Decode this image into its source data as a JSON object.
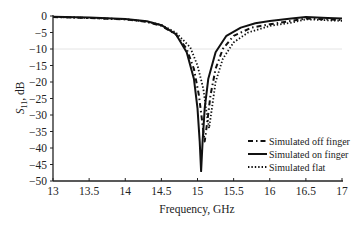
{
  "chart_data": {
    "type": "line",
    "title": "",
    "xlabel": "Frequency, GHz",
    "ylabel_main": "S",
    "ylabel_sub": "11",
    "ylabel_suffix": ", dB",
    "xlim": [
      13,
      17
    ],
    "ylim": [
      -50,
      0
    ],
    "xticks": [
      13,
      13.5,
      14,
      14.5,
      15,
      15.5,
      16,
      16.5,
      17
    ],
    "xtick_labels": [
      "13",
      "13.5",
      "14",
      "14.5",
      "15",
      "15.5",
      "16",
      "16.5",
      "17"
    ],
    "yticks": [
      0,
      -5,
      -10,
      -15,
      -20,
      -25,
      -30,
      -35,
      -40,
      -45,
      -50
    ],
    "ytick_labels": [
      "0",
      "−5",
      "−10",
      "−15",
      "−20",
      "−25",
      "−30",
      "−35",
      "−40",
      "−45",
      "−50"
    ],
    "reference_line": -10,
    "grid": false,
    "legend_position": "lower right",
    "series": [
      {
        "name": "Simulated off finger",
        "style": "dashdot",
        "points": [
          [
            13,
            -0.3
          ],
          [
            13.5,
            -0.6
          ],
          [
            14,
            -1.0
          ],
          [
            14.3,
            -1.8
          ],
          [
            14.5,
            -3.0
          ],
          [
            14.7,
            -5.5
          ],
          [
            14.85,
            -10
          ],
          [
            14.95,
            -16
          ],
          [
            15.02,
            -24
          ],
          [
            15.07,
            -33
          ],
          [
            15.1,
            -38
          ],
          [
            15.13,
            -33
          ],
          [
            15.18,
            -24
          ],
          [
            15.25,
            -16
          ],
          [
            15.35,
            -10
          ],
          [
            15.5,
            -6
          ],
          [
            15.75,
            -3.5
          ],
          [
            16,
            -2.5
          ],
          [
            16.3,
            -1.5
          ],
          [
            16.5,
            -0.8
          ],
          [
            16.8,
            -1.0
          ],
          [
            17,
            -1.2
          ]
        ]
      },
      {
        "name": "Simulated on finger",
        "style": "solid",
        "points": [
          [
            13,
            -0.2
          ],
          [
            13.5,
            -0.5
          ],
          [
            14,
            -0.9
          ],
          [
            14.3,
            -1.6
          ],
          [
            14.5,
            -2.8
          ],
          [
            14.7,
            -5.5
          ],
          [
            14.85,
            -11
          ],
          [
            14.95,
            -19
          ],
          [
            15.0,
            -28
          ],
          [
            15.03,
            -38
          ],
          [
            15.05,
            -47
          ],
          [
            15.07,
            -38
          ],
          [
            15.1,
            -28
          ],
          [
            15.15,
            -19
          ],
          [
            15.25,
            -11
          ],
          [
            15.4,
            -6
          ],
          [
            15.6,
            -3.5
          ],
          [
            15.8,
            -2.2
          ],
          [
            16,
            -1.5
          ],
          [
            16.3,
            -0.8
          ],
          [
            16.5,
            -0.3
          ],
          [
            16.8,
            -0.6
          ],
          [
            17,
            -0.8
          ]
        ]
      },
      {
        "name": "Simulated flat",
        "style": "dotted",
        "points": [
          [
            13,
            -0.3
          ],
          [
            13.5,
            -0.6
          ],
          [
            14,
            -1.0
          ],
          [
            14.3,
            -1.7
          ],
          [
            14.5,
            -2.7
          ],
          [
            14.7,
            -5.0
          ],
          [
            14.9,
            -9.5
          ],
          [
            15.0,
            -15
          ],
          [
            15.08,
            -22
          ],
          [
            15.13,
            -30
          ],
          [
            15.16,
            -34
          ],
          [
            15.2,
            -28
          ],
          [
            15.25,
            -20
          ],
          [
            15.35,
            -13
          ],
          [
            15.5,
            -8
          ],
          [
            15.7,
            -5
          ],
          [
            16,
            -3
          ],
          [
            16.3,
            -2
          ],
          [
            16.5,
            -1
          ],
          [
            16.8,
            -1.3
          ],
          [
            17,
            -1.5
          ]
        ]
      }
    ]
  }
}
